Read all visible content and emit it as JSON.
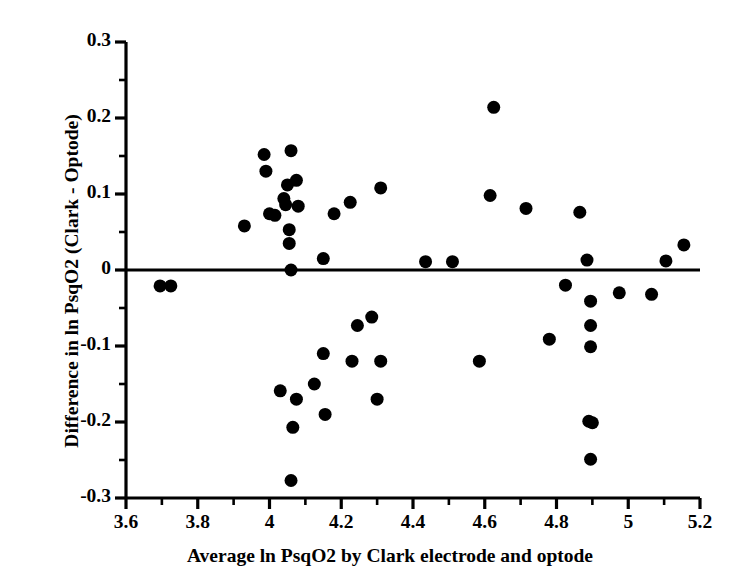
{
  "chart_data": {
    "type": "scatter",
    "title": "",
    "xlabel": "Average ln PsqO2 by Clark electrode and optode",
    "ylabel": "Difference in ln PsqO2 (Clark - Optode)",
    "xlim": [
      3.6,
      5.2
    ],
    "ylim": [
      -0.3,
      0.3
    ],
    "xticks": [
      3.6,
      3.8,
      4,
      4.2,
      4.4,
      4.6,
      4.8,
      5,
      5.2
    ],
    "xtick_labels": [
      "3.6",
      "3.8",
      "4",
      "4.2",
      "4.4",
      "4.6",
      "4.8",
      "5",
      "5.2"
    ],
    "yticks": [
      -0.3,
      -0.2,
      -0.1,
      0,
      0.1,
      0.2,
      0.3
    ],
    "ytick_labels": [
      "-0.3",
      "-0.2",
      "-0.1",
      "0",
      "0.1",
      "0.2",
      "0.3"
    ],
    "x_minor_tick_step": 0.1,
    "y_minor_tick_step": 0.05,
    "grid": false,
    "legend": false,
    "legend_position": "none",
    "reference_line_y": 0,
    "marker": "filled-circle",
    "marker_color": "#000000",
    "marker_size_px": 13,
    "n_points": 56,
    "points": [
      {
        "x": 3.695,
        "y": -0.021
      },
      {
        "x": 3.725,
        "y": -0.021
      },
      {
        "x": 3.93,
        "y": 0.058
      },
      {
        "x": 3.985,
        "y": 0.152
      },
      {
        "x": 3.99,
        "y": 0.13
      },
      {
        "x": 4.0,
        "y": 0.074
      },
      {
        "x": 4.015,
        "y": 0.072
      },
      {
        "x": 4.04,
        "y": 0.094
      },
      {
        "x": 4.045,
        "y": 0.086
      },
      {
        "x": 4.05,
        "y": 0.112
      },
      {
        "x": 4.055,
        "y": 0.053
      },
      {
        "x": 4.055,
        "y": 0.035
      },
      {
        "x": 4.06,
        "y": 0.157
      },
      {
        "x": 4.06,
        "y": 0.0
      },
      {
        "x": 4.075,
        "y": 0.118
      },
      {
        "x": 4.08,
        "y": 0.084
      },
      {
        "x": 4.03,
        "y": -0.159
      },
      {
        "x": 4.075,
        "y": -0.17
      },
      {
        "x": 4.125,
        "y": -0.15
      },
      {
        "x": 4.065,
        "y": -0.207
      },
      {
        "x": 4.06,
        "y": -0.277
      },
      {
        "x": 4.15,
        "y": -0.11
      },
      {
        "x": 4.155,
        "y": -0.19
      },
      {
        "x": 4.15,
        "y": 0.015
      },
      {
        "x": 4.18,
        "y": 0.074
      },
      {
        "x": 4.225,
        "y": 0.089
      },
      {
        "x": 4.31,
        "y": 0.108
      },
      {
        "x": 4.23,
        "y": -0.12
      },
      {
        "x": 4.245,
        "y": -0.073
      },
      {
        "x": 4.285,
        "y": -0.062
      },
      {
        "x": 4.31,
        "y": -0.12
      },
      {
        "x": 4.3,
        "y": -0.17
      },
      {
        "x": 4.435,
        "y": 0.011
      },
      {
        "x": 4.51,
        "y": 0.011
      },
      {
        "x": 4.585,
        "y": -0.12
      },
      {
        "x": 4.625,
        "y": 0.214
      },
      {
        "x": 4.615,
        "y": 0.098
      },
      {
        "x": 4.715,
        "y": 0.081
      },
      {
        "x": 4.78,
        "y": -0.091
      },
      {
        "x": 4.825,
        "y": -0.02
      },
      {
        "x": 4.865,
        "y": 0.076
      },
      {
        "x": 4.885,
        "y": 0.013
      },
      {
        "x": 4.895,
        "y": -0.041
      },
      {
        "x": 4.895,
        "y": -0.073
      },
      {
        "x": 4.895,
        "y": -0.101
      },
      {
        "x": 4.89,
        "y": -0.199
      },
      {
        "x": 4.9,
        "y": -0.201
      },
      {
        "x": 4.895,
        "y": -0.249
      },
      {
        "x": 4.975,
        "y": -0.03
      },
      {
        "x": 5.065,
        "y": -0.032
      },
      {
        "x": 5.105,
        "y": 0.012
      },
      {
        "x": 5.155,
        "y": 0.033
      }
    ]
  },
  "axes": {
    "y_axis_title": "Difference in ln PsqO2 (Clark - Optode)",
    "x_axis_title": "Average ln PsqO2 by Clark electrode and optode",
    "axis_color": "#000000",
    "background_color": "#ffffff"
  }
}
